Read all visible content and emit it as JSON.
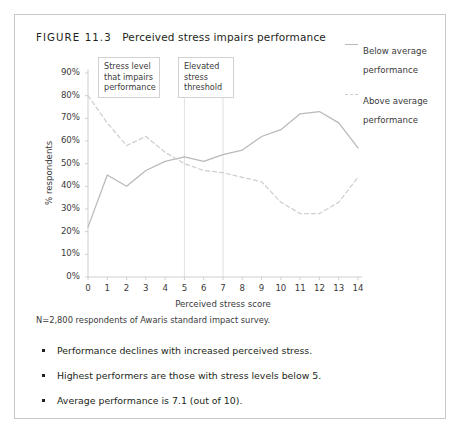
{
  "figure": {
    "number": "FIGURE 11.3",
    "title": "Perceived stress impairs performance"
  },
  "footnote": "N=2,800 respondents of Awaris standard impact survey.",
  "bullets": [
    "Performance declines with increased perceived stress.",
    "Highest performers are those with stress levels below 5.",
    "Average performance is 7.1 (out of 10)."
  ],
  "annotations": [
    {
      "id": "impair",
      "text": "Stress level that impairs performance",
      "at_x": 5
    },
    {
      "id": "elevated",
      "text": "Elevated stress threshold",
      "at_x": 7
    }
  ],
  "legend": [
    {
      "label": "Below average performance",
      "style": "solid",
      "color": "#b9b9b9"
    },
    {
      "label": "Above average performance",
      "style": "dashed",
      "color": "#cfcfcf"
    }
  ],
  "chart_data": {
    "type": "line",
    "title": "Perceived stress impairs performance",
    "xlabel": "Perceived stress score",
    "ylabel": "% respondents",
    "x": [
      0,
      1,
      2,
      3,
      4,
      5,
      6,
      7,
      8,
      9,
      10,
      11,
      12,
      13,
      14
    ],
    "xtick_labels": [
      "0",
      "1",
      "2",
      "3",
      "4",
      "5",
      "6",
      "7",
      "8",
      "9",
      "10",
      "11",
      "12",
      "13",
      "14"
    ],
    "ytick_labels": [
      "0%",
      "10%",
      "20%",
      "30%",
      "40%",
      "50%",
      "60%",
      "70%",
      "80%",
      "90%"
    ],
    "ytick_values": [
      0,
      10,
      20,
      30,
      40,
      50,
      60,
      70,
      80,
      90
    ],
    "ylim": [
      0,
      90
    ],
    "xlim": [
      0,
      14
    ],
    "grid": false,
    "legend_position": "right",
    "reference_lines": [
      5,
      7
    ],
    "series": [
      {
        "name": "Below average performance",
        "style": "solid",
        "color": "#b9b9b9",
        "values": [
          22,
          45,
          40,
          47,
          51,
          53,
          51,
          54,
          56,
          62,
          65,
          72,
          73,
          68,
          57
        ]
      },
      {
        "name": "Above average performance",
        "style": "dashed",
        "color": "#cfcfcf",
        "values": [
          80,
          68,
          58,
          62,
          55,
          50,
          47,
          46,
          44,
          42,
          33,
          28,
          28,
          33,
          44
        ]
      }
    ]
  }
}
